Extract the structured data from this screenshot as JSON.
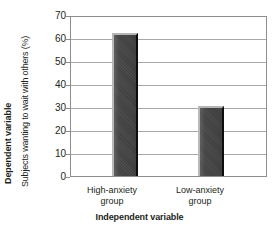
{
  "chart_data": {
    "type": "bar",
    "title": "",
    "categories": [
      "High-anxiety group",
      "Low-anxiety group"
    ],
    "values": [
      63,
      31
    ],
    "xlabel": "Independent variable",
    "ylabel": "Subjects wanting to wait with others (%)",
    "ylabel_group": "Dependent variable",
    "ylim": [
      0,
      70
    ],
    "ytick_labels": [
      "70",
      "60",
      "50",
      "40",
      "30",
      "20",
      "10",
      "0"
    ],
    "ytick_values": [
      70,
      60,
      50,
      40,
      30,
      20,
      10,
      0
    ],
    "grid": "horizontal",
    "legend": "none",
    "bar_color": "#454545",
    "grid_color": "#a8a8a8",
    "frame_color": "#8d8d8d",
    "background": "#ffffff"
  },
  "axes": {
    "y": {
      "group_title": "Dependent variable",
      "title": "Subjects wanting to wait with others (%)"
    },
    "x": {
      "title": "Independent variable",
      "categories": [
        {
          "line1": "High-anxiety",
          "line2": "group"
        },
        {
          "line1": "Low-anxiety",
          "line2": "group"
        }
      ]
    }
  }
}
